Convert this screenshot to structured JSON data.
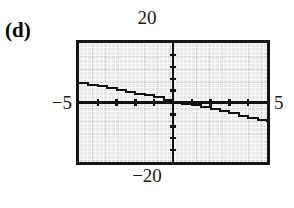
{
  "figure": {
    "panel_label": "(d)",
    "window": {
      "ymax_label": "20",
      "ymin_label": "−20",
      "xmin_label": "−5",
      "xmax_label": "5"
    }
  },
  "chart_data": {
    "type": "line",
    "title": "(d)",
    "xlabel": "",
    "ylabel": "",
    "xlim": [
      -5,
      5
    ],
    "ylim": [
      -20,
      20
    ],
    "grid": true,
    "legend": null,
    "axis_ticks": {
      "x_tick_values": [
        -4,
        -3,
        -2,
        -1,
        0,
        1,
        2,
        3,
        4
      ],
      "y_tick_values": [
        -16,
        -12,
        -8,
        -4,
        0,
        4,
        8,
        12,
        16
      ],
      "x_tick_labels": [
        "",
        "",
        "",
        "",
        "",
        "",
        "",
        "",
        ""
      ],
      "y_tick_labels": [
        "",
        "",
        "",
        "",
        "",
        "",
        "",
        "",
        ""
      ]
    },
    "series": [
      {
        "name": "curve",
        "style": "stepped-pixel",
        "color": "#111111",
        "x": [
          -5.0,
          -4.5,
          -4.0,
          -3.5,
          -3.0,
          -2.5,
          -2.0,
          -1.5,
          -1.0,
          -0.5,
          0.0,
          0.5,
          1.0,
          1.5,
          2.0,
          2.5,
          3.0,
          3.5,
          4.0,
          4.5,
          5.0
        ],
        "y": [
          6.6,
          6.0,
          5.4,
          4.8,
          4.2,
          3.6,
          3.0,
          2.4,
          1.8,
          1.0,
          0.2,
          -0.4,
          -1.0,
          -1.6,
          -2.2,
          -2.8,
          -3.6,
          -4.4,
          -5.2,
          -6.0,
          -6.6
        ]
      }
    ]
  }
}
